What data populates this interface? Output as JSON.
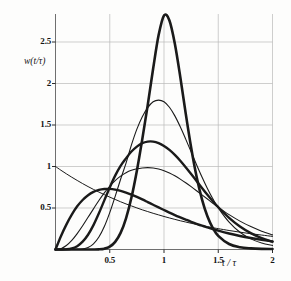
{
  "figure": {
    "name": "probability-density-family-plot",
    "background": "#fdfdfc",
    "ink_color": "#1a1a1a",
    "grid_color": "#b9b9b9"
  },
  "axes": {
    "x_title": "t / τ",
    "y_title": "w(t/τ)",
    "x_ticks": [
      "0.5",
      "1",
      "1.5",
      "2"
    ],
    "y_ticks": [
      "0.5",
      "1",
      "1.5",
      "2",
      "2.5"
    ]
  },
  "chart_data": {
    "type": "line",
    "title": "",
    "xlabel": "t / τ",
    "ylabel": "w(t/τ)",
    "xlim": [
      0,
      2
    ],
    "ylim": [
      0,
      2.95
    ],
    "xticks": [
      0.5,
      1,
      1.5,
      2
    ],
    "yticks": [
      0.5,
      1,
      1.5,
      2,
      2.5
    ],
    "grid": true,
    "legend": "none",
    "x": [
      0,
      0.05,
      0.1,
      0.15,
      0.2,
      0.25,
      0.3,
      0.35,
      0.4,
      0.45,
      0.5,
      0.55,
      0.6,
      0.65,
      0.7,
      0.75,
      0.8,
      0.85,
      0.9,
      0.95,
      1.0,
      1.05,
      1.1,
      1.15,
      1.2,
      1.25,
      1.3,
      1.35,
      1.4,
      1.45,
      1.5,
      1.6,
      1.7,
      1.8,
      1.9,
      2.0
    ],
    "series": [
      {
        "name": "n=1 exponential decay",
        "stroke_width": 1.0,
        "peak_x": 0.0,
        "peak_y": 1.0,
        "values": [
          1.0,
          0.955,
          0.912,
          0.871,
          0.832,
          0.794,
          0.758,
          0.724,
          0.692,
          0.661,
          0.631,
          0.603,
          0.575,
          0.549,
          0.525,
          0.501,
          0.478,
          0.457,
          0.436,
          0.417,
          0.398,
          0.38,
          0.363,
          0.346,
          0.331,
          0.316,
          0.302,
          0.288,
          0.275,
          0.263,
          0.251,
          0.229,
          0.209,
          0.19,
          0.174,
          0.158
        ]
      },
      {
        "name": "n=2 broad low mode",
        "stroke_width": 2.4,
        "peak_x": 0.47,
        "peak_y": 0.73,
        "values": [
          0.0,
          0.16,
          0.3,
          0.42,
          0.52,
          0.596,
          0.654,
          0.694,
          0.718,
          0.729,
          0.73,
          0.722,
          0.707,
          0.686,
          0.661,
          0.633,
          0.603,
          0.571,
          0.539,
          0.507,
          0.476,
          0.445,
          0.415,
          0.387,
          0.36,
          0.334,
          0.31,
          0.287,
          0.266,
          0.246,
          0.227,
          0.193,
          0.163,
          0.138,
          0.116,
          0.098
        ]
      },
      {
        "name": "n=3 intermediate mode",
        "stroke_width": 1.1,
        "peak_x": 0.78,
        "peak_y": 0.99,
        "values": [
          0.0,
          0.01,
          0.048,
          0.11,
          0.192,
          0.286,
          0.388,
          0.49,
          0.59,
          0.682,
          0.762,
          0.83,
          0.884,
          0.925,
          0.954,
          0.972,
          0.982,
          0.986,
          0.982,
          0.97,
          0.95,
          0.922,
          0.888,
          0.848,
          0.804,
          0.757,
          0.708,
          0.658,
          0.608,
          0.558,
          0.51,
          0.42,
          0.342,
          0.276,
          0.221,
          0.176
        ]
      },
      {
        "name": "n=5 sharper mode",
        "stroke_width": 2.4,
        "peak_x": 0.9,
        "peak_y": 1.3,
        "values": [
          0.0,
          0.0,
          0.002,
          0.012,
          0.04,
          0.094,
          0.178,
          0.294,
          0.436,
          0.592,
          0.748,
          0.89,
          1.008,
          1.098,
          1.18,
          1.24,
          1.282,
          1.3,
          1.3,
          1.282,
          1.248,
          1.2,
          1.14,
          1.07,
          0.992,
          0.91,
          0.826,
          0.742,
          0.66,
          0.582,
          0.51,
          0.382,
          0.278,
          0.198,
          0.138,
          0.094
        ]
      },
      {
        "name": "n=8 narrow mode",
        "stroke_width": 1.1,
        "peak_x": 0.95,
        "peak_y": 1.8,
        "values": [
          0.0,
          0.0,
          0.0,
          0.0,
          0.001,
          0.006,
          0.024,
          0.068,
          0.15,
          0.276,
          0.444,
          0.64,
          0.846,
          1.04,
          1.26,
          1.45,
          1.6,
          1.71,
          1.78,
          1.8,
          1.78,
          1.714,
          1.61,
          1.478,
          1.33,
          1.176,
          1.022,
          0.874,
          0.736,
          0.612,
          0.502,
          0.33,
          0.208,
          0.128,
          0.078,
          0.048
        ]
      },
      {
        "name": "n=20 sharp peak",
        "stroke_width": 2.6,
        "peak_x": 0.97,
        "peak_y": 2.84,
        "values": [
          0.0,
          0.0,
          0.0,
          0.0,
          0.0,
          0.0,
          0.0,
          0.0,
          0.002,
          0.01,
          0.034,
          0.092,
          0.2,
          0.376,
          0.626,
          0.95,
          1.33,
          1.74,
          2.18,
          2.58,
          2.82,
          2.76,
          2.48,
          2.08,
          1.64,
          1.23,
          0.88,
          0.604,
          0.4,
          0.258,
          0.164,
          0.066,
          0.028,
          0.014,
          0.008,
          0.006
        ]
      }
    ]
  }
}
